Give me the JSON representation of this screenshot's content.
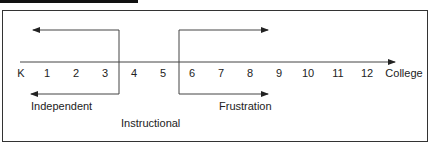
{
  "diagram": {
    "scale": {
      "labels": [
        "K",
        "1",
        "2",
        "3",
        "4",
        "5",
        "6",
        "7",
        "8",
        "9",
        "10",
        "11",
        "12",
        "College"
      ]
    },
    "zones": {
      "independent": "Independent",
      "instructional": "Instructional",
      "frustration": "Frustration"
    }
  }
}
